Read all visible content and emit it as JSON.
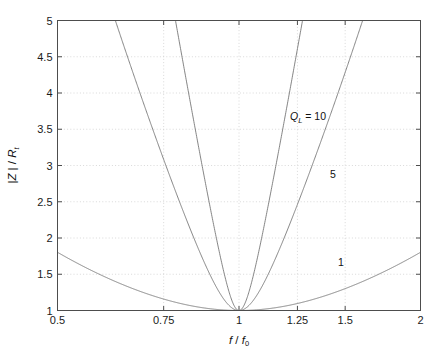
{
  "chart_data": {
    "type": "line",
    "title": "",
    "xlabel": "f / f0",
    "ylabel": "|Z | / Rt",
    "xlabel_main": "f",
    "xlabel_den": "f",
    "xlabel_den_sub": "0",
    "ylabel_num": "|Z | /",
    "ylabel_den": "R",
    "ylabel_den_sub": "t",
    "xscale": "log",
    "yscale": "linear",
    "xlim": [
      0.5,
      2
    ],
    "ylim": [
      1,
      5
    ],
    "grid": true,
    "grid_style": "dotted",
    "legend_position": "inline-annotations",
    "xticks": [
      0.5,
      0.75,
      1,
      1.25,
      1.5,
      2
    ],
    "xticklabels": [
      "0.5",
      "0.75",
      "1",
      "1.25",
      "1.5",
      "2"
    ],
    "yticks": [
      1,
      1.5,
      2,
      2.5,
      3,
      3.5,
      4,
      4.5,
      5
    ],
    "yticklabels": [
      "1",
      "1.5",
      "2",
      "2.5",
      "3",
      "3.5",
      "4",
      "4.5",
      "5"
    ],
    "formula": "|Z|/Rt = sqrt(1 + Q^2 (f/f0 - f0/f)^2)",
    "series": [
      {
        "name": "Q_L = 10",
        "Q": 10,
        "color": "#6f6f6f",
        "x": [
          0.5,
          0.55,
          0.6,
          0.65,
          0.7,
          0.75,
          0.8,
          0.85,
          0.9,
          0.95,
          1.0,
          1.05,
          1.1,
          1.15,
          1.2,
          1.25,
          1.3,
          1.4,
          1.5,
          1.6,
          1.7,
          1.8,
          1.9,
          2.0
        ],
        "values": [
          4.85,
          4.11,
          3.5,
          2.99,
          2.55,
          2.17,
          1.84,
          1.56,
          1.33,
          1.13,
          1.0,
          1.12,
          1.32,
          1.57,
          1.85,
          2.17,
          2.51,
          3.24,
          4.03,
          4.86,
          5.74,
          6.65,
          7.59,
          8.56
        ]
      },
      {
        "name": "5",
        "Q": 5,
        "color": "#6f6f6f",
        "x": [
          0.5,
          0.55,
          0.6,
          0.65,
          0.7,
          0.75,
          0.8,
          0.85,
          0.9,
          0.95,
          1.0,
          1.05,
          1.1,
          1.15,
          1.2,
          1.25,
          1.3,
          1.4,
          1.5,
          1.6,
          1.7,
          1.8,
          1.9,
          2.0
        ],
        "values": [
          3.5,
          2.98,
          2.56,
          2.21,
          1.91,
          1.66,
          1.45,
          1.28,
          1.15,
          1.05,
          1.0,
          1.05,
          1.16,
          1.32,
          1.52,
          1.74,
          1.98,
          2.49,
          3.02,
          3.57,
          4.13,
          4.7,
          5.27,
          5.85
        ]
      },
      {
        "name": "1",
        "Q": 1,
        "color": "#6f6f6f",
        "x": [
          0.5,
          0.55,
          0.6,
          0.65,
          0.7,
          0.75,
          0.8,
          0.85,
          0.9,
          0.95,
          1.0,
          1.05,
          1.1,
          1.15,
          1.2,
          1.25,
          1.3,
          1.4,
          1.5,
          1.6,
          1.7,
          1.8,
          1.9,
          2.0
        ],
        "values": [
          1.8,
          1.68,
          1.58,
          1.49,
          1.42,
          1.36,
          1.3,
          1.25,
          1.21,
          1.15,
          1.0,
          1.05,
          1.09,
          1.14,
          1.2,
          1.25,
          1.31,
          1.44,
          1.58,
          1.72,
          1.86,
          2.0,
          2.15,
          2.29
        ]
      }
    ],
    "annotations": [
      {
        "text": "Q_L = 10",
        "label_main": "Q",
        "label_sub": "L",
        "label_rest": " = 10",
        "x_px": 290,
        "y_px": 120
      },
      {
        "text": "5",
        "x_px": 330,
        "y_px": 178
      },
      {
        "text": "1",
        "x_px": 338,
        "y_px": 266
      }
    ],
    "axes_color": "#4d4d4d",
    "grid_color": "#c8c8c8",
    "line_color": "#707070",
    "background": "#ffffff"
  }
}
